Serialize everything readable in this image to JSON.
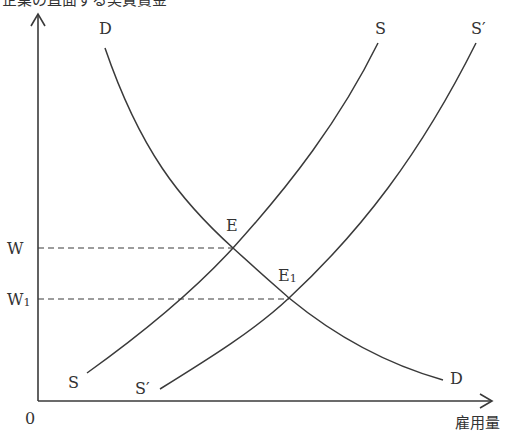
{
  "diagram": {
    "y_axis_label": "企業の直面する実質賃金",
    "x_axis_label": "雇用量",
    "origin_label": "0",
    "wage_levels": [
      {
        "label": "W",
        "sub": ""
      },
      {
        "label": "W",
        "sub": "1"
      }
    ],
    "curves": {
      "demand": {
        "label_top": "D",
        "label_bottom": "D"
      },
      "supply": {
        "label_top": "S",
        "label_bottom": "S"
      },
      "supply_shifted": {
        "label_top": "S′",
        "label_bottom": "S′"
      }
    },
    "equilibria": [
      {
        "label": "E",
        "sub": ""
      },
      {
        "label": "E",
        "sub": "1"
      }
    ],
    "colors": {
      "line": "#3a3a3a",
      "background": "#ffffff"
    }
  }
}
